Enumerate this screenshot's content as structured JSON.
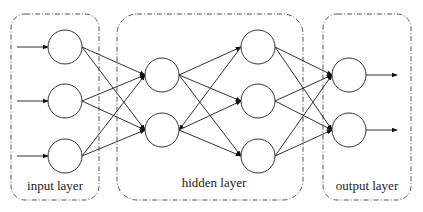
{
  "diagram": {
    "type": "neural-network",
    "layers": [
      {
        "id": "input",
        "label": "input layer",
        "box": {
          "x": 11,
          "y": 14,
          "w": 88,
          "h": 186,
          "rx": 14
        },
        "label_pos": {
          "x": 55,
          "y": 190
        },
        "nodes": [
          {
            "x": 65,
            "y": 47
          },
          {
            "x": 65,
            "y": 101
          },
          {
            "x": 65,
            "y": 156
          }
        ]
      },
      {
        "id": "hidden",
        "label": "hidden layer",
        "box": {
          "x": 117,
          "y": 14,
          "w": 186,
          "h": 186,
          "rx": 20
        },
        "label_pos": {
          "x": 214,
          "y": 187
        },
        "sublayers": [
          {
            "nodes": [
              {
                "x": 162,
                "y": 75
              },
              {
                "x": 162,
                "y": 130
              }
            ]
          },
          {
            "nodes": [
              {
                "x": 258,
                "y": 47
              },
              {
                "x": 258,
                "y": 101
              },
              {
                "x": 258,
                "y": 156
              }
            ]
          }
        ]
      },
      {
        "id": "output",
        "label": "output layer",
        "box": {
          "x": 323,
          "y": 14,
          "w": 88,
          "h": 186,
          "rx": 14
        },
        "label_pos": {
          "x": 367,
          "y": 190
        },
        "nodes": [
          {
            "x": 349,
            "y": 75
          },
          {
            "x": 349,
            "y": 130
          }
        ]
      }
    ],
    "node_radius": 17,
    "input_arrows": [
      {
        "x1": 17,
        "y1": 47,
        "x2": 48,
        "y2": 47
      },
      {
        "x1": 17,
        "y1": 101,
        "x2": 48,
        "y2": 101
      },
      {
        "x1": 17,
        "y1": 156,
        "x2": 48,
        "y2": 156
      }
    ],
    "output_arrows": [
      {
        "x1": 366,
        "y1": 75,
        "x2": 397,
        "y2": 75
      },
      {
        "x1": 366,
        "y1": 130,
        "x2": 397,
        "y2": 130
      }
    ],
    "edges": [
      {
        "from": [
          82,
          47
        ],
        "to": [
          145,
          75
        ]
      },
      {
        "from": [
          82,
          47
        ],
        "to": [
          145,
          130
        ]
      },
      {
        "from": [
          82,
          101
        ],
        "to": [
          145,
          75
        ]
      },
      {
        "from": [
          82,
          101
        ],
        "to": [
          145,
          130
        ]
      },
      {
        "from": [
          82,
          156
        ],
        "to": [
          145,
          75
        ]
      },
      {
        "from": [
          82,
          156
        ],
        "to": [
          145,
          130
        ]
      },
      {
        "from": [
          179,
          75
        ],
        "to": [
          241,
          47
        ]
      },
      {
        "from": [
          179,
          75
        ],
        "to": [
          241,
          101
        ]
      },
      {
        "from": [
          179,
          75
        ],
        "to": [
          241,
          156
        ]
      },
      {
        "from": [
          241,
          47
        ],
        "to": [
          179,
          130
        ]
      },
      {
        "from": [
          179,
          130
        ],
        "to": [
          241,
          101
        ]
      },
      {
        "from": [
          179,
          130
        ],
        "to": [
          241,
          156
        ]
      },
      {
        "from": [
          275,
          47
        ],
        "to": [
          332,
          75
        ]
      },
      {
        "from": [
          275,
          47
        ],
        "to": [
          332,
          130
        ]
      },
      {
        "from": [
          275,
          101
        ],
        "to": [
          332,
          75
        ]
      },
      {
        "from": [
          275,
          101
        ],
        "to": [
          332,
          130
        ]
      },
      {
        "from": [
          275,
          156
        ],
        "to": [
          332,
          75
        ]
      },
      {
        "from": [
          275,
          156
        ],
        "to": [
          332,
          130
        ]
      }
    ]
  },
  "labels": {
    "input": "input layer",
    "hidden": "hidden layer",
    "output": "output layer"
  }
}
